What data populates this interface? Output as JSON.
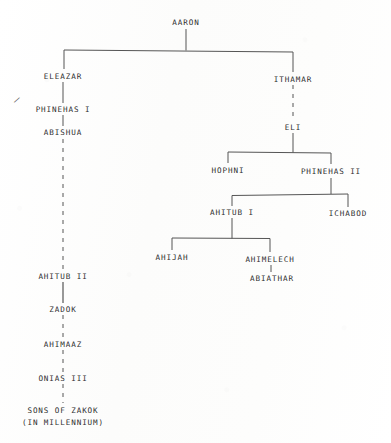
{
  "document": {
    "kind": "genealogy-chart",
    "subject": "Aaronic priestly line",
    "background_color": "#fdfdfd",
    "ink_color": "#2e2e2e",
    "line_color": "#555555"
  },
  "nodes": [
    {
      "id": "aaron",
      "label": "AARON",
      "x": 186,
      "y": 22,
      "line_style": "solid"
    },
    {
      "id": "eleazar",
      "label": "ELEAZAR",
      "x": 63,
      "y": 76,
      "line_style": "solid"
    },
    {
      "id": "phinehas_i",
      "label": "PHINEHAS I",
      "x": 63,
      "y": 109,
      "line_style": "solid"
    },
    {
      "id": "abishua",
      "label": "ABISHUA",
      "x": 63,
      "y": 132,
      "line_style": "solid"
    },
    {
      "id": "ahitub_ii",
      "label": "AHITUB II",
      "x": 63,
      "y": 276,
      "line_style": "dashed"
    },
    {
      "id": "zadok",
      "label": "ZADOK",
      "x": 63,
      "y": 309,
      "line_style": "solid"
    },
    {
      "id": "ahimaaz",
      "label": "AHIMAAZ",
      "x": 63,
      "y": 344,
      "line_style": "dashed"
    },
    {
      "id": "onias_iii",
      "label": "ONIAS III",
      "x": 63,
      "y": 378,
      "line_style": "dashed"
    },
    {
      "id": "sons_of_zakok",
      "label": "SONS OF ZAKOK",
      "x": 63,
      "y": 410,
      "line_style": "dashed",
      "label_line2": "(IN MILLENNIUM)"
    },
    {
      "id": "ithamar",
      "label": "ITHAMAR",
      "x": 293,
      "y": 79,
      "line_style": "solid"
    },
    {
      "id": "eli",
      "label": "ELI",
      "x": 293,
      "y": 127,
      "line_style": "dashed"
    },
    {
      "id": "hophni",
      "label": "HOPHNI",
      "x": 228,
      "y": 170,
      "line_style": "solid"
    },
    {
      "id": "phinehas_ii",
      "label": "PHINEHAS II",
      "x": 331,
      "y": 171,
      "line_style": "solid"
    },
    {
      "id": "ahitub_i",
      "label": "AHITUB I",
      "x": 232,
      "y": 212,
      "line_style": "solid"
    },
    {
      "id": "ichabod",
      "label": "ICHABOD",
      "x": 348,
      "y": 213,
      "line_style": "solid"
    },
    {
      "id": "ahijah",
      "label": "AHIJAH",
      "x": 172,
      "y": 257,
      "line_style": "solid"
    },
    {
      "id": "ahimelech",
      "label": "AHIMELECH",
      "x": 270,
      "y": 259,
      "line_style": "solid"
    },
    {
      "id": "abiathar",
      "label": "ABIATHAR",
      "x": 272,
      "y": 278,
      "line_style": "solid"
    }
  ],
  "edges": [
    {
      "from": "aaron",
      "to": "eleazar",
      "style": "solid"
    },
    {
      "from": "aaron",
      "to": "ithamar",
      "style": "solid"
    },
    {
      "from": "eleazar",
      "to": "phinehas_i",
      "style": "solid"
    },
    {
      "from": "phinehas_i",
      "to": "abishua",
      "style": "solid"
    },
    {
      "from": "abishua",
      "to": "ahitub_ii",
      "style": "dashed"
    },
    {
      "from": "ahitub_ii",
      "to": "zadok",
      "style": "solid"
    },
    {
      "from": "zadok",
      "to": "ahimaaz",
      "style": "dashed"
    },
    {
      "from": "ahimaaz",
      "to": "onias_iii",
      "style": "dashed"
    },
    {
      "from": "onias_iii",
      "to": "sons_of_zakok",
      "style": "dashed"
    },
    {
      "from": "ithamar",
      "to": "eli",
      "style": "dashed"
    },
    {
      "from": "eli",
      "to": "hophni",
      "style": "solid"
    },
    {
      "from": "eli",
      "to": "phinehas_ii",
      "style": "solid"
    },
    {
      "from": "phinehas_ii",
      "to": "ahitub_i",
      "style": "solid"
    },
    {
      "from": "phinehas_ii",
      "to": "ichabod",
      "style": "solid"
    },
    {
      "from": "ahitub_i",
      "to": "ahijah",
      "style": "solid"
    },
    {
      "from": "ahitub_i",
      "to": "ahimelech",
      "style": "solid"
    },
    {
      "from": "ahimelech",
      "to": "abiathar",
      "style": "solid"
    }
  ],
  "marks": [
    {
      "id": "stray-slash",
      "glyph": "/",
      "x": 17,
      "y": 100
    }
  ]
}
